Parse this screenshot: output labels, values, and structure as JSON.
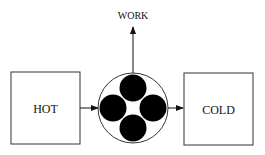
{
  "diagram": {
    "top_label": "WORK",
    "left_box_label": "HOT",
    "right_box_label": "COLD",
    "colors": {
      "stroke": "#222222",
      "fill": "#000000",
      "background": "#ffffff"
    }
  }
}
